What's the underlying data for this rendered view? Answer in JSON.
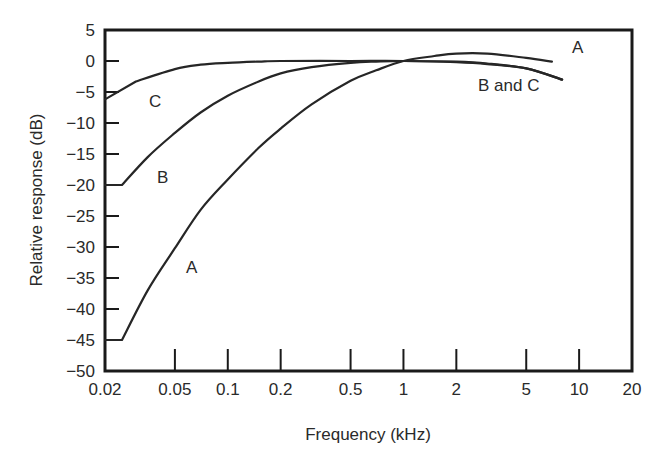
{
  "chart_data": {
    "type": "line",
    "title": "",
    "xlabel": "Frequency (kHz)",
    "ylabel": "Relative response (dB)",
    "xscale": "log",
    "xlim": [
      0.02,
      20
    ],
    "ylim": [
      -50,
      5
    ],
    "grid": false,
    "legend": "inline curve labels",
    "x_ticks": [
      0.02,
      0.05,
      0.1,
      0.2,
      0.5,
      1,
      2,
      5,
      10,
      20
    ],
    "x_tick_labels": [
      "0.02",
      "0.05",
      "0.1",
      "0.2",
      "0.5",
      "1",
      "2",
      "5",
      "10",
      "20"
    ],
    "y_ticks": [
      5,
      0,
      -5,
      -10,
      -15,
      -20,
      -25,
      -30,
      -35,
      -40,
      -45,
      -50
    ],
    "y_tick_labels": [
      "5",
      "0",
      "−5",
      "−10",
      "−15",
      "−20",
      "−25",
      "−30",
      "−35",
      "−40",
      "−45",
      "−50"
    ],
    "series": [
      {
        "name": "A",
        "x": [
          0.02,
          0.025,
          0.035,
          0.05,
          0.07,
          0.1,
          0.15,
          0.2,
          0.3,
          0.5,
          0.7,
          1,
          1.5,
          2,
          3,
          5,
          7
        ],
        "values": [
          -45,
          -45,
          -37,
          -30.2,
          -24,
          -19.1,
          -14,
          -10.9,
          -7,
          -3.2,
          -1.5,
          0,
          0.8,
          1.2,
          1.2,
          0.5,
          -0.1
        ]
      },
      {
        "name": "B",
        "x": [
          0.02,
          0.025,
          0.035,
          0.05,
          0.07,
          0.1,
          0.15,
          0.2,
          0.3,
          0.5,
          0.7,
          1,
          2,
          3,
          5,
          8
        ],
        "values": [
          -20,
          -20,
          -15.5,
          -11.6,
          -8.3,
          -5.6,
          -3.3,
          -2.0,
          -1.0,
          -0.3,
          -0.1,
          0,
          -0.1,
          -0.4,
          -1.2,
          -3
        ]
      },
      {
        "name": "C",
        "x": [
          0.02,
          0.03,
          0.05,
          0.07,
          0.1,
          0.15,
          0.2,
          0.5,
          1,
          2,
          3,
          5,
          8
        ],
        "values": [
          -6.2,
          -3.3,
          -1.3,
          -0.6,
          -0.3,
          -0.1,
          0,
          0,
          0,
          -0.2,
          -0.5,
          -1.2,
          -3
        ]
      }
    ],
    "annotations": [
      {
        "text": "A",
        "near": "end of A curve, ~7 kHz, +1 dB"
      },
      {
        "text": "B and C",
        "near": "~3 kHz, -4 dB"
      },
      {
        "text": "C",
        "near": "~0.03 kHz, -10 dB"
      },
      {
        "text": "B",
        "near": "~0.04 kHz, -24 dB"
      },
      {
        "text": "A",
        "near": "~0.06 kHz, -38 dB"
      }
    ]
  },
  "labels": {
    "xlabel": "Frequency (kHz)",
    "ylabel": "Relative response (dB)",
    "curve_A_end": "A",
    "curve_BC_end": "B and C",
    "curve_C": "C",
    "curve_B": "B",
    "curve_A": "A"
  },
  "style": {
    "line_color": "#262626",
    "axis_color": "#1a1a1a",
    "background": "#ffffff"
  }
}
